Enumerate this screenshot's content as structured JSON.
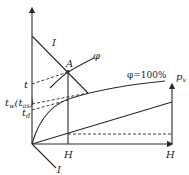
{
  "diagram": {
    "type": "psychrometric I-H (enthalpy-humidity) chart construction",
    "axes": {
      "vertical_axis_label": "",
      "horizontal_axis_label": "H",
      "right_axis_label": "p",
      "right_axis_sub": "v"
    },
    "lines": {
      "isenthalpic_top_label": "I",
      "isenthalpic_bottom_label": "I",
      "rh_curve_label": "φ",
      "saturation_curve_label": "φ=100%"
    },
    "points": {
      "state_point_label": "A",
      "h_tick_label": "H"
    },
    "left_axis_labels": {
      "t": "t",
      "tw": "t",
      "tw_sub": "w",
      "tas_open": "(t",
      "tas_sub": "as",
      "tas_close": ")",
      "td": "t",
      "td_sub": "d"
    },
    "colors": {
      "line": "#2a2a2a",
      "background": "#ffffff"
    }
  }
}
